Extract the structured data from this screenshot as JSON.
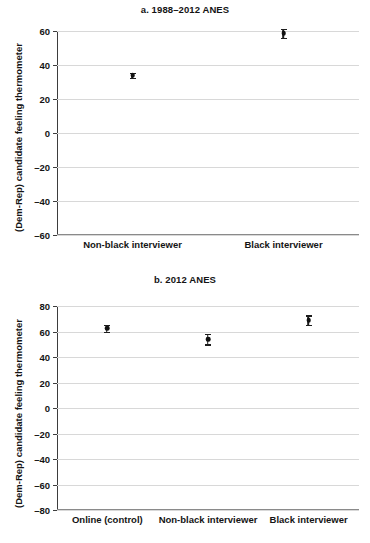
{
  "chart_data": [
    {
      "type": "scatter",
      "panel": "a",
      "title": "a. 1988–2012 ANES",
      "xlabel": "",
      "ylabel": "(Dem-Rep) candidate feeling thermometer",
      "ylim": [
        -60,
        60
      ],
      "yticks": [
        60,
        40,
        20,
        0,
        -20,
        -40,
        -60
      ],
      "ytick_labels": [
        "60",
        "40",
        "20",
        "0",
        "–20",
        "–40",
        "–60"
      ],
      "grid": true,
      "legend": "none",
      "categories": [
        "Non-black interviewer",
        "Black interviewer"
      ],
      "values": [
        34.0,
        58.7
      ],
      "error_low": [
        1.4,
        2.6
      ],
      "error_high": [
        1.4,
        2.6
      ]
    },
    {
      "type": "scatter",
      "panel": "b",
      "title": "b. 2012 ANES",
      "xlabel": "",
      "ylabel": "(Dem-Rep) candidate feeling thermometer",
      "ylim": [
        -80,
        80
      ],
      "yticks": [
        80,
        60,
        40,
        20,
        0,
        -20,
        -40,
        -60,
        -80
      ],
      "ytick_labels": [
        "80",
        "60",
        "40",
        "20",
        "0",
        "–20",
        "–40",
        "–60",
        "–80"
      ],
      "grid": true,
      "legend": "none",
      "categories": [
        "Online (control)",
        "Non-black interviewer",
        "Black interviewer"
      ],
      "values": [
        62.5,
        54.0,
        69.0
      ],
      "error_low": [
        2.6,
        4.0,
        3.6
      ],
      "error_high": [
        2.6,
        4.0,
        3.6
      ]
    }
  ],
  "panel_a": {
    "title": "a. 1988–2012 ANES",
    "ylabel": "(Dem-Rep) candidate feeling thermometer",
    "ytick_labels": [
      "60",
      "40",
      "20",
      "0",
      "–20",
      "–40",
      "–60"
    ],
    "categories": [
      "Non-black interviewer",
      "Black interviewer"
    ]
  },
  "panel_b": {
    "title": "b. 2012 ANES",
    "ylabel": "(Dem-Rep) candidate feeling thermometer",
    "ytick_labels": [
      "80",
      "60",
      "40",
      "20",
      "0",
      "–20",
      "–40",
      "–60",
      "–80"
    ],
    "categories": [
      "Online (control)",
      "Non-black interviewer",
      "Black interviewer"
    ]
  }
}
